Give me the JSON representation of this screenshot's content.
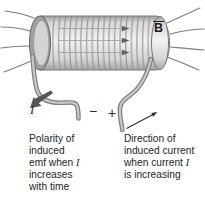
{
  "diagram": {
    "field_label": "B",
    "current_label": "I",
    "minus_sign": "−",
    "plus_sign": "+",
    "caption_left": {
      "line1": "Polarity of",
      "line2": "induced",
      "line3_pre": "emf when ",
      "line3_sym": "I",
      "line4": "increases",
      "line5": "with time"
    },
    "caption_right": {
      "line1": "Direction of",
      "line2": "induced current",
      "line3_pre": "when current ",
      "line3_sym": "I",
      "line4": "is increasing"
    },
    "colors": {
      "coil_highlight": "#f2f2f2",
      "coil_shadow": "#9e9e9e",
      "coil_turn_line": "#8b8b8b",
      "field_line": "#7d7d7d",
      "wire_core": "#c8c8c8",
      "wire_edge": "#7f7f7f",
      "arrow_dark": "#565656",
      "text": "#262626"
    }
  }
}
